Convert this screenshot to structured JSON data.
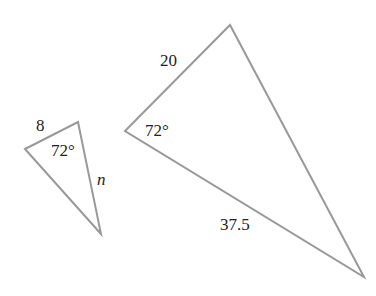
{
  "diagram": {
    "stroke_color": "#999999",
    "text_color": "#222222",
    "small_triangle": {
      "vertices": [
        [
          25,
          149
        ],
        [
          78,
          122
        ],
        [
          101,
          234
        ]
      ],
      "side_label": "8",
      "angle_label": "72°",
      "unknown_label": "n"
    },
    "large_triangle": {
      "vertices": [
        [
          125,
          131
        ],
        [
          230,
          25
        ],
        [
          364,
          277
        ]
      ],
      "side_label_top": "20",
      "angle_label": "72°",
      "side_label_bottom": "37.5"
    }
  }
}
